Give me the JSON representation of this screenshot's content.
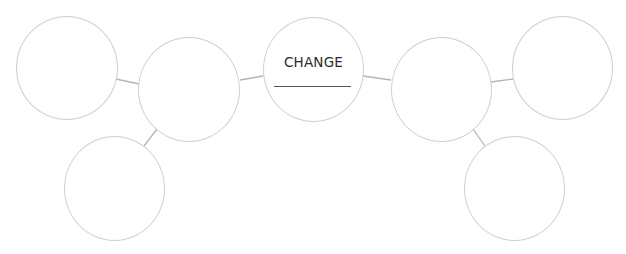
{
  "diagram": {
    "type": "bubble-map",
    "center": {
      "label": "CHANGE",
      "line_placeholder": ""
    },
    "colors": {
      "circle_stroke": "#cfcfcf",
      "connector": "#b5b5b5",
      "text": "#2a2a2a",
      "underline": "#555555"
    },
    "nodes": [
      {
        "id": "left-top",
        "label": ""
      },
      {
        "id": "left-mid",
        "label": ""
      },
      {
        "id": "left-bottom",
        "label": ""
      },
      {
        "id": "right-mid",
        "label": ""
      },
      {
        "id": "right-top",
        "label": ""
      },
      {
        "id": "right-bottom",
        "label": ""
      }
    ]
  }
}
